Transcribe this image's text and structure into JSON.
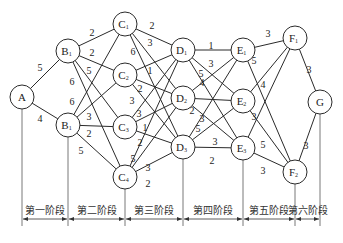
{
  "nodes": [
    {
      "id": "A",
      "label": "A",
      "sub": "",
      "x": 22,
      "y": 97
    },
    {
      "id": "B1",
      "label": "B",
      "sub": "1",
      "x": 68,
      "y": 51
    },
    {
      "id": "B2",
      "label": "B",
      "sub": "1",
      "x": 68,
      "y": 125
    },
    {
      "id": "C1",
      "label": "C",
      "sub": "1",
      "x": 125,
      "y": 24
    },
    {
      "id": "C2",
      "label": "C",
      "sub": "2",
      "x": 125,
      "y": 75
    },
    {
      "id": "C3",
      "label": "C",
      "sub": "3",
      "x": 125,
      "y": 127
    },
    {
      "id": "C4",
      "label": "C",
      "sub": "4",
      "x": 125,
      "y": 177
    },
    {
      "id": "D1",
      "label": "D",
      "sub": "1",
      "x": 183,
      "y": 50
    },
    {
      "id": "D2",
      "label": "D",
      "sub": "2",
      "x": 183,
      "y": 98
    },
    {
      "id": "D3",
      "label": "D",
      "sub": "3",
      "x": 183,
      "y": 147
    },
    {
      "id": "E1",
      "label": "E",
      "sub": "1",
      "x": 243,
      "y": 50
    },
    {
      "id": "E2",
      "label": "E",
      "sub": "2",
      "x": 243,
      "y": 101
    },
    {
      "id": "E3",
      "label": "E",
      "sub": "3",
      "x": 243,
      "y": 148
    },
    {
      "id": "F1",
      "label": "F",
      "sub": "1",
      "x": 295,
      "y": 38
    },
    {
      "id": "F2",
      "label": "F",
      "sub": "2",
      "x": 295,
      "y": 172
    },
    {
      "id": "G",
      "label": "G",
      "sub": "",
      "x": 320,
      "y": 102
    }
  ],
  "edges": [
    {
      "from": "A",
      "to": "B1",
      "w": "5",
      "lx": 40,
      "ly": 67
    },
    {
      "from": "A",
      "to": "B2",
      "w": "4",
      "lx": 40,
      "ly": 118
    },
    {
      "from": "B1",
      "to": "C1",
      "w": "2",
      "lx": 92,
      "ly": 32
    },
    {
      "from": "B1",
      "to": "C2",
      "w": "2",
      "lx": 92,
      "ly": 52
    },
    {
      "from": "B1",
      "to": "C3",
      "w": "5",
      "lx": 89,
      "ly": 70
    },
    {
      "from": "B1",
      "to": "C4",
      "w": "6",
      "lx": 72,
      "ly": 81
    },
    {
      "from": "B2",
      "to": "C1",
      "w": "6",
      "lx": 72,
      "ly": 101
    },
    {
      "from": "B2",
      "to": "C2",
      "w": "3",
      "lx": 89,
      "ly": 116
    },
    {
      "from": "B2",
      "to": "C3",
      "w": "2",
      "lx": 89,
      "ly": 133
    },
    {
      "from": "B2",
      "to": "C4",
      "w": "5",
      "lx": 81,
      "ly": 150
    },
    {
      "from": "C1",
      "to": "D1",
      "w": "2",
      "lx": 152,
      "ly": 25
    },
    {
      "from": "C1",
      "to": "D2",
      "w": "3",
      "lx": 150,
      "ly": 42
    },
    {
      "from": "C1",
      "to": "D3",
      "w": "6",
      "lx": 133,
      "ly": 51
    },
    {
      "from": "C2",
      "to": "D1",
      "w": "1",
      "lx": 150,
      "ly": 70
    },
    {
      "from": "C2",
      "to": "D2",
      "w": "2",
      "lx": 140,
      "ly": 88
    },
    {
      "from": "C2",
      "to": "D3",
      "w": "3",
      "lx": 132,
      "ly": 100
    },
    {
      "from": "C3",
      "to": "D1",
      "w": "3",
      "lx": 139,
      "ly": 113
    },
    {
      "from": "C3",
      "to": "D2",
      "w": "1",
      "lx": 145,
      "ly": 127
    },
    {
      "from": "C3",
      "to": "D3",
      "w": "2",
      "lx": 140,
      "ly": 142
    },
    {
      "from": "C4",
      "to": "D1",
      "w": "5",
      "lx": 133,
      "ly": 158
    },
    {
      "from": "C4",
      "to": "D2",
      "w": "3",
      "lx": 148,
      "ly": 167
    },
    {
      "from": "C4",
      "to": "D3",
      "w": "2",
      "lx": 148,
      "ly": 183
    },
    {
      "from": "D1",
      "to": "E1",
      "w": "1",
      "lx": 211,
      "ly": 45
    },
    {
      "from": "D1",
      "to": "E2",
      "w": "3",
      "lx": 211,
      "ly": 63
    },
    {
      "from": "D1",
      "to": "E3",
      "w": "5",
      "lx": 201,
      "ly": 73
    },
    {
      "from": "D2",
      "to": "E1",
      "w": "4",
      "lx": 202,
      "ly": 82
    },
    {
      "from": "D2",
      "to": "E2",
      "w": "2",
      "lx": 192,
      "ly": 110
    },
    {
      "from": "D2",
      "to": "E3",
      "w": "3",
      "lx": 202,
      "ly": 118
    },
    {
      "from": "D3",
      "to": "E1",
      "w": "5",
      "lx": 198,
      "ly": 128
    },
    {
      "from": "D3",
      "to": "E2",
      "w": "3",
      "lx": 215,
      "ly": 141
    },
    {
      "from": "D3",
      "to": "E3",
      "w": "2",
      "lx": 212,
      "ly": 160
    },
    {
      "from": "E1",
      "to": "F1",
      "w": "3",
      "lx": 268,
      "ly": 33
    },
    {
      "from": "E1",
      "to": "F2",
      "w": "5",
      "lx": 254,
      "ly": 60
    },
    {
      "from": "E2",
      "to": "F1",
      "w": "4",
      "lx": 263,
      "ly": 84
    },
    {
      "from": "E2",
      "to": "F2",
      "w": "3",
      "lx": 254,
      "ly": 116
    },
    {
      "from": "E3",
      "to": "F1",
      "w": "5",
      "lx": 263,
      "ly": 144
    },
    {
      "from": "E3",
      "to": "F2",
      "w": "3",
      "lx": 263,
      "ly": 170
    },
    {
      "from": "F1",
      "to": "G",
      "w": "3",
      "lx": 309,
      "ly": 69
    },
    {
      "from": "F2",
      "to": "G",
      "w": "3",
      "lx": 306,
      "ly": 145
    }
  ],
  "dividers": [
    {
      "x": 22,
      "from_node": "A"
    },
    {
      "x": 68,
      "from_node": "B2"
    },
    {
      "x": 125,
      "from_node": "C4"
    },
    {
      "x": 183,
      "from_node": "D3"
    },
    {
      "x": 243,
      "from_node": "E3"
    },
    {
      "x": 295,
      "from_node": "F2"
    },
    {
      "x": 320,
      "from_node": "G"
    }
  ],
  "stages": [
    {
      "label": "第一阶段",
      "x1": 22,
      "x2": 68
    },
    {
      "label": "第二阶段",
      "x1": 68,
      "x2": 125
    },
    {
      "label": "第三阶段",
      "x1": 125,
      "x2": 183
    },
    {
      "label": "第四阶段",
      "x1": 183,
      "x2": 243
    },
    {
      "label": "第五阶段",
      "x1": 243,
      "x2": 295
    },
    {
      "label": "第六阶段",
      "x1": 295,
      "x2": 320
    }
  ],
  "layout": {
    "node_radius": 12,
    "divider_bottom": 226,
    "stage_label_y": 210,
    "arrow_y": 219
  }
}
